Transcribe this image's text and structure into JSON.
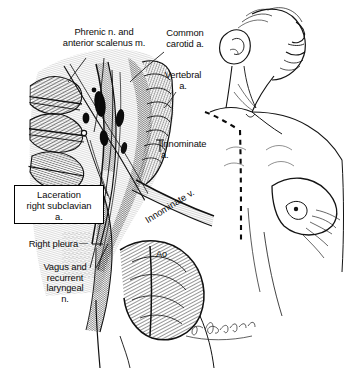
{
  "figure": {
    "domain": "medical-illustration",
    "background_color": "#ffffff",
    "ink_color": "#111111",
    "width": 347,
    "height": 368
  },
  "labels": {
    "phrenic": "Phrenic n. and\nanterior scalenus m.",
    "common_carotid": "Common\ncarotid a.",
    "vertebral": "Vertebral\na.",
    "innominate_a": "Innominate\na.",
    "innominate_v": "Innominate v.",
    "laceration_box": "Laceration\nright subclavian\na.",
    "right_pleura": "Right pleura",
    "right_pleura_arrow": "—",
    "vagus": "Vagus and\nrecurrent\nlaryngeal\nn.",
    "aorta": "Ao"
  },
  "annotations": {
    "signature": "artist signature",
    "incision_line": "dashed sternotomy and cervical incision"
  },
  "regions": {
    "surgical_field": "left dissected neck and upper chest field",
    "patient_figure": "right-side head turned, neck and chest outline"
  }
}
